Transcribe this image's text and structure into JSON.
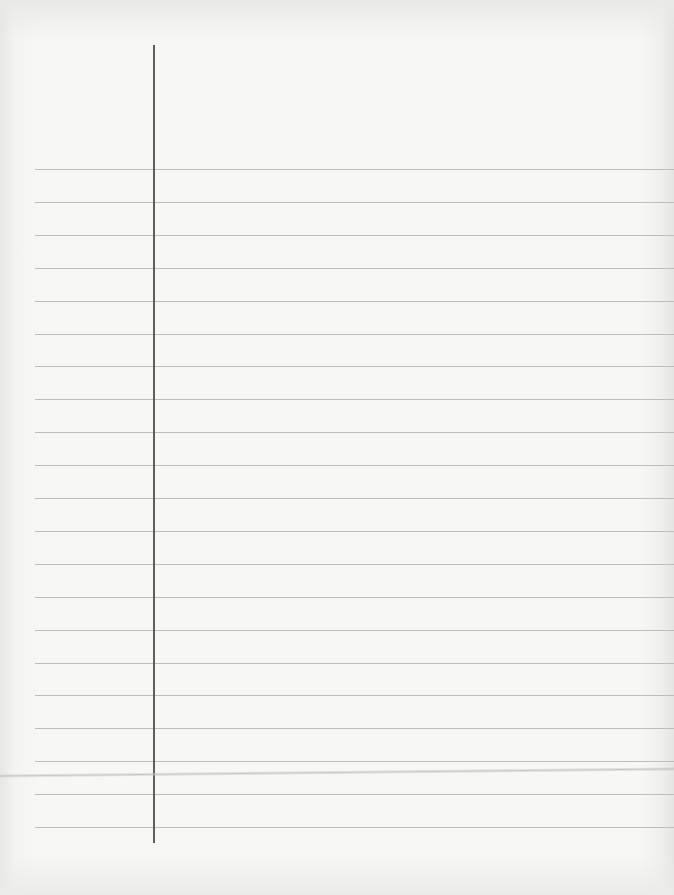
{
  "page": {
    "type": "ruled-notebook-paper",
    "content_text": "",
    "colors": {
      "paper": "#f7f7f6",
      "rule_line": "#bdbdbb",
      "margin_line": "#5e5e5e"
    },
    "margin_line": {
      "x": 154,
      "top": 45,
      "bottom": 843
    },
    "rules": {
      "left": 35,
      "first_y": 169,
      "spacing": 32.9,
      "count": 21
    },
    "crease_y": 774
  }
}
